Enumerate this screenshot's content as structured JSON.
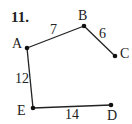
{
  "problem_number": "11.",
  "points": {
    "A": {
      "label": "A",
      "x": 27,
      "y": 48
    },
    "B": {
      "label": "B",
      "x": 84,
      "y": 26
    },
    "C": {
      "label": "C",
      "x": 115,
      "y": 56
    },
    "D": {
      "label": "D",
      "x": 111,
      "y": 105
    },
    "E": {
      "label": "E",
      "x": 33,
      "y": 108
    }
  },
  "segments": [
    {
      "from": "A",
      "to": "B",
      "length": "7"
    },
    {
      "from": "B",
      "to": "C",
      "length": "6"
    },
    {
      "from": "A",
      "to": "E",
      "length": "12"
    },
    {
      "from": "E",
      "to": "D",
      "length": "14"
    }
  ],
  "colors": {
    "stroke": "#222222",
    "background": "#ffffff"
  }
}
